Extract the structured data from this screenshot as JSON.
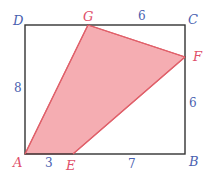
{
  "diagram": {
    "colors": {
      "frame": "#333333",
      "fill": "#f4a9ae",
      "stroke": "#e0606a",
      "vertex_blue": "#4a5fb0",
      "vertex_pink": "#e0506a",
      "number": "#4a5fb0"
    },
    "vertices": {
      "A": {
        "label": "A"
      },
      "B": {
        "label": "B"
      },
      "C": {
        "label": "C"
      },
      "D": {
        "label": "D"
      },
      "E": {
        "label": "E"
      },
      "F": {
        "label": "F"
      },
      "G": {
        "label": "G"
      }
    },
    "lengths": {
      "AD": "8",
      "GC": "6",
      "FB": "6",
      "AE": "3",
      "EB": "7"
    },
    "shaded_region": "AEFG"
  }
}
